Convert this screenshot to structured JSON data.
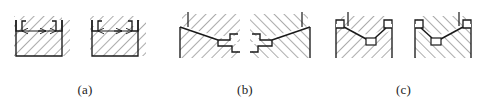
{
  "sheet": {
    "title": "Engineering cross-section detail figures",
    "background_color": "#ffffff",
    "line_color": "#1a1a1a",
    "hatch_color": "#4a4a4a",
    "width": 487,
    "height": 102
  },
  "figures": [
    {
      "id": "a",
      "caption": "(a)",
      "description": "Two identical rectangular sectioned blocks with small rectangular corner recesses at the upper left and upper right, joined by a horizontal dimension line with inward pointing arrowheads.",
      "variant_count": 2,
      "hatch_angle_deg": 45,
      "features": [
        "rectangular-body",
        "upper-left-corner-recess",
        "upper-right-corner-recess",
        "horizontal-dimension-line",
        "inward-arrowheads"
      ]
    },
    {
      "id": "b",
      "caption": "(b)",
      "description": "Mirrored pair of sectioned blocks with a diagonal chamfer face descending from the upper corner to a stepped notch at the opposite lower side.",
      "variant_count": 2,
      "hatch_angle_deg": 45,
      "features": [
        "diagonal-chamfer-face",
        "vertical-leader-line",
        "stepped-notch",
        "sectioned-body"
      ]
    },
    {
      "id": "c",
      "caption": "(c)",
      "description": "Mirrored pair of sectioned blocks containing a V shaped groove with corner recesses at both upper ends and a small square symbol marking the groove vertex.",
      "variant_count": 2,
      "hatch_angle_deg": 45,
      "features": [
        "v-groove",
        "upper-left-corner-recess",
        "upper-right-corner-recess",
        "vertex-square-marker",
        "vertical-leader-line"
      ]
    }
  ]
}
